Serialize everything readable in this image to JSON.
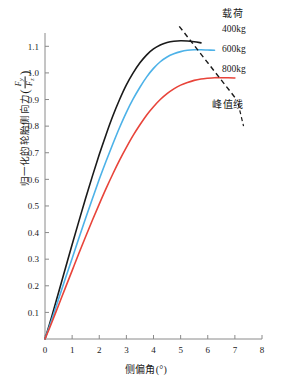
{
  "chart_data": {
    "type": "line",
    "title": "",
    "xlabel": "侧偏角(°)",
    "ylabel": "归一化的轮胎侧向力",
    "ylabel_fraction_num": "F",
    "ylabel_fraction_num_sub": "y",
    "ylabel_fraction_den": "F",
    "ylabel_fraction_den_sub": "z",
    "xlim": [
      0,
      8
    ],
    "ylim": [
      0,
      1.15
    ],
    "xticks": [
      "0",
      "1",
      "2",
      "3",
      "4",
      "5",
      "6",
      "7",
      "8"
    ],
    "xtick_values": [
      0,
      1,
      2,
      3,
      4,
      5,
      6,
      7,
      8
    ],
    "yticks": [
      "0.1",
      "0.2",
      "0.3",
      "0.4",
      "0.5",
      "0.6",
      "0.7",
      "0.8",
      "0.9",
      "1.0",
      "1.1"
    ],
    "ytick_values": [
      0.1,
      0.2,
      0.3,
      0.4,
      0.5,
      0.6,
      0.7,
      0.8,
      0.9,
      1.0,
      1.1
    ],
    "grid": false,
    "legend_position": "outside-top-right",
    "series": [
      {
        "name": "400kg",
        "color": "#1a1a1a",
        "peak_x": 5.3,
        "peak_y": 1.12,
        "x": [
          0,
          0.25,
          0.5,
          0.75,
          1.0,
          1.25,
          1.5,
          1.75,
          2.0,
          2.25,
          2.5,
          2.75,
          3.0,
          3.25,
          3.5,
          3.75,
          4.0,
          4.25,
          4.5,
          4.75,
          5.0,
          5.25,
          5.5,
          5.75
        ],
        "values": [
          0,
          0.085,
          0.175,
          0.265,
          0.355,
          0.443,
          0.53,
          0.613,
          0.693,
          0.768,
          0.838,
          0.9,
          0.955,
          1.0,
          1.038,
          1.068,
          1.09,
          1.105,
          1.114,
          1.119,
          1.121,
          1.12,
          1.117,
          1.113
        ]
      },
      {
        "name": "600kg",
        "color": "#4db2e8",
        "peak_x": 5.9,
        "peak_y": 1.087,
        "x": [
          0,
          0.25,
          0.5,
          0.75,
          1.0,
          1.25,
          1.5,
          1.75,
          2.0,
          2.25,
          2.5,
          2.75,
          3.0,
          3.25,
          3.5,
          3.75,
          4.0,
          4.25,
          4.5,
          4.75,
          5.0,
          5.25,
          5.5,
          5.75,
          6.0,
          6.25
        ],
        "values": [
          0,
          0.073,
          0.15,
          0.227,
          0.303,
          0.38,
          0.455,
          0.528,
          0.6,
          0.668,
          0.733,
          0.795,
          0.852,
          0.902,
          0.946,
          0.985,
          1.017,
          1.042,
          1.06,
          1.072,
          1.08,
          1.085,
          1.087,
          1.087,
          1.086,
          1.085
        ]
      },
      {
        "name": "800kg",
        "color": "#e8443a",
        "peak_x": 6.8,
        "peak_y": 0.982,
        "x": [
          0,
          0.25,
          0.5,
          0.75,
          1.0,
          1.25,
          1.5,
          1.75,
          2.0,
          2.25,
          2.5,
          2.75,
          3.0,
          3.25,
          3.5,
          3.75,
          4.0,
          4.25,
          4.5,
          4.75,
          5.0,
          5.25,
          5.5,
          5.75,
          6.0,
          6.25,
          6.5,
          6.75,
          7.0
        ],
        "values": [
          0,
          0.062,
          0.127,
          0.192,
          0.257,
          0.322,
          0.385,
          0.447,
          0.507,
          0.565,
          0.62,
          0.672,
          0.72,
          0.765,
          0.805,
          0.842,
          0.873,
          0.9,
          0.922,
          0.94,
          0.954,
          0.964,
          0.972,
          0.977,
          0.98,
          0.982,
          0.982,
          0.982,
          0.981
        ]
      }
    ],
    "annotations": [
      {
        "name": "peak-line",
        "label": "峰值线",
        "style": "dashed",
        "color": "#1a1a1a",
        "x1": 4.95,
        "y1": 1.175,
        "x2": 7.1,
        "y2": 0.895
      }
    ]
  },
  "legend": {
    "title": "载荷",
    "entries": [
      {
        "label": "400kg"
      },
      {
        "label": "600kg"
      },
      {
        "label": "800kg"
      }
    ]
  },
  "axes": {
    "x_title_text": "侧偏角",
    "x_title_unit": "(°)",
    "y_title_text": "归一化的轮胎侧向力"
  }
}
